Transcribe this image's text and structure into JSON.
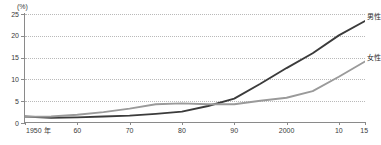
{
  "chart_data": {
    "type": "line",
    "title": "",
    "xlabel": "",
    "ylabel": "",
    "unit_label": "(%)",
    "x": [
      1950,
      1955,
      1960,
      1965,
      1970,
      1975,
      1980,
      1985,
      1990,
      1995,
      2000,
      2005,
      2010,
      2015
    ],
    "xtick_labels": [
      "1950 年",
      "60",
      "70",
      "80",
      "90",
      "2000",
      "10",
      "15"
    ],
    "xtick_values": [
      1950,
      1960,
      1970,
      1980,
      1990,
      2000,
      2010,
      2015
    ],
    "xlim": [
      1950,
      2015
    ],
    "ytick_labels": [
      "0",
      "5",
      "10",
      "15",
      "20",
      "25"
    ],
    "ytick_values": [
      0,
      5,
      10,
      15,
      20,
      25
    ],
    "ylim": [
      0,
      25
    ],
    "grid": true,
    "legend_position": "right-inline",
    "series": [
      {
        "name": "男性",
        "color": "#3b3b3b",
        "values": [
          1.5,
          1.2,
          1.3,
          1.5,
          1.7,
          2.1,
          2.6,
          3.9,
          5.6,
          9.0,
          12.6,
          16.0,
          20.1,
          23.4
        ]
      },
      {
        "name": "女性",
        "color": "#9a9a9a",
        "values": [
          1.4,
          1.5,
          1.9,
          2.5,
          3.3,
          4.3,
          4.5,
          4.3,
          4.3,
          5.1,
          5.8,
          7.3,
          10.6,
          14.1
        ]
      }
    ]
  },
  "axis": {
    "line_color": "#8a8a8a",
    "grid_color": "#b9b9b9"
  }
}
